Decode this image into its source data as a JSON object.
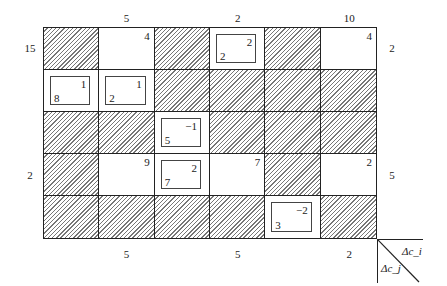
{
  "top_labels": [
    {
      "col": 1,
      "text": "5"
    },
    {
      "col": 3,
      "text": "2"
    },
    {
      "col": 5,
      "text": "10"
    }
  ],
  "left_labels": [
    {
      "row": 0,
      "text": "15"
    },
    {
      "row": 3,
      "text": "2"
    }
  ],
  "right_labels": [
    {
      "row": 0,
      "text": "2"
    },
    {
      "row": 3,
      "text": "5"
    }
  ],
  "bottom_labels": [
    {
      "col": 1,
      "text": "5"
    },
    {
      "col": 3,
      "text": "5"
    },
    {
      "col": 5,
      "text": "2"
    }
  ],
  "legend": {
    "row_label": "Δc_i",
    "col_label": "Δc_j"
  },
  "cells": [
    [
      {
        "type": "hatched"
      },
      {
        "type": "open",
        "corner": "4"
      },
      {
        "type": "hatched"
      },
      {
        "type": "basic",
        "top": "2",
        "bottom": "2"
      },
      {
        "type": "hatched"
      },
      {
        "type": "open",
        "corner": "4"
      }
    ],
    [
      {
        "type": "basic",
        "top": "1",
        "bottom": "8"
      },
      {
        "type": "basic",
        "top": "1",
        "bottom": "2"
      },
      {
        "type": "hatched"
      },
      {
        "type": "hatched"
      },
      {
        "type": "hatched"
      },
      {
        "type": "hatched"
      }
    ],
    [
      {
        "type": "hatched"
      },
      {
        "type": "hatched"
      },
      {
        "type": "basic",
        "top": "−1",
        "bottom": "5"
      },
      {
        "type": "hatched"
      },
      {
        "type": "hatched"
      },
      {
        "type": "hatched"
      }
    ],
    [
      {
        "type": "hatched"
      },
      {
        "type": "open",
        "corner": "9"
      },
      {
        "type": "basic",
        "top": "2",
        "bottom": "7"
      },
      {
        "type": "open",
        "corner": "7"
      },
      {
        "type": "hatched"
      },
      {
        "type": "open",
        "corner": "2"
      }
    ],
    [
      {
        "type": "hatched"
      },
      {
        "type": "hatched"
      },
      {
        "type": "hatched"
      },
      {
        "type": "hatched"
      },
      {
        "type": "basic",
        "top": "−2",
        "bottom": "3"
      },
      {
        "type": "hatched"
      }
    ]
  ]
}
